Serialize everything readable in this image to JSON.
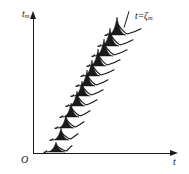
{
  "figure": {
    "title_visible": false,
    "background_color": "#ffffff",
    "ink_color": "#1a1a1a"
  },
  "axes": {
    "y_label": "t",
    "y_label_sub": "m",
    "x_label": "t",
    "origin_label": "O",
    "y_axis_name": "vertical-axis",
    "x_axis_name": "horizontal-axis"
  },
  "annotations": {
    "trend_line_label_lhs": "t",
    "trend_line_label_eq": "=",
    "trend_line_label_rhs": "ζ",
    "trend_line_label_sub": "m"
  },
  "chart_data": {
    "type": "line",
    "title": "",
    "xlabel": "t",
    "ylabel": "t_m",
    "grid": false,
    "legend": "none",
    "annotations": [
      "t = ζm"
    ],
    "pulses": [
      {
        "index": 1,
        "x": 56,
        "y": 152,
        "amp": 10,
        "halfwidth": 9,
        "tail": 16
      },
      {
        "index": 2,
        "x": 61,
        "y": 140,
        "amp": 12,
        "halfwidth": 8,
        "tail": 17
      },
      {
        "index": 3,
        "x": 66,
        "y": 128,
        "amp": 13,
        "halfwidth": 8,
        "tail": 18
      },
      {
        "index": 4,
        "x": 71,
        "y": 117,
        "amp": 14,
        "halfwidth": 8,
        "tail": 19
      },
      {
        "index": 5,
        "x": 77,
        "y": 106,
        "amp": 15,
        "halfwidth": 8,
        "tail": 20
      },
      {
        "index": 6,
        "x": 82,
        "y": 96,
        "amp": 15,
        "halfwidth": 8,
        "tail": 21
      },
      {
        "index": 7,
        "x": 87,
        "y": 86,
        "amp": 16,
        "halfwidth": 8,
        "tail": 21
      },
      {
        "index": 8,
        "x": 92,
        "y": 76,
        "amp": 16,
        "halfwidth": 8,
        "tail": 22
      },
      {
        "index": 9,
        "x": 98,
        "y": 66,
        "amp": 17,
        "halfwidth": 8,
        "tail": 22
      },
      {
        "index": 10,
        "x": 104,
        "y": 56,
        "amp": 17,
        "halfwidth": 9,
        "tail": 23
      },
      {
        "index": 11,
        "x": 110,
        "y": 46,
        "amp": 18,
        "halfwidth": 9,
        "tail": 23
      },
      {
        "index": 12,
        "x": 117,
        "y": 35,
        "amp": 18,
        "halfwidth": 9,
        "tail": 24
      }
    ],
    "trend_line": {
      "x1": 127,
      "y1": 28,
      "x2": 132,
      "y2": 11
    }
  }
}
